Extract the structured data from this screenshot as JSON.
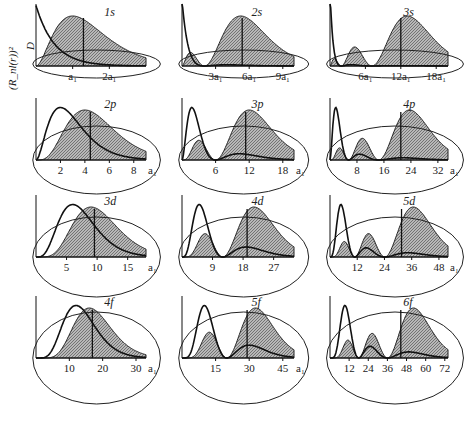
{
  "figure": {
    "y_axis_label_outer": "(R_nl(r))²",
    "y_axis_label_inner": "D",
    "x_axis_label": "r",
    "unit_label": "a₁"
  },
  "panels": [
    {
      "title": "1s",
      "n": 1,
      "l": 0,
      "ticks": [
        "a₁",
        "2a₁"
      ],
      "tick_values": [
        1,
        2
      ],
      "xmax": 3,
      "peaks": 1
    },
    {
      "title": "2s",
      "n": 2,
      "l": 0,
      "ticks": [
        "3a₁",
        "6a₁",
        "9a₁"
      ],
      "tick_values": [
        3,
        6,
        9
      ],
      "xmax": 10,
      "peaks": 2
    },
    {
      "title": "3s",
      "n": 3,
      "l": 0,
      "ticks": [
        "6a₁",
        "12a₁",
        "18a₁"
      ],
      "tick_values": [
        6,
        12,
        18
      ],
      "xmax": 20,
      "peaks": 3
    },
    {
      "title": "2p",
      "n": 2,
      "l": 1,
      "ticks": [
        "2",
        "4",
        "6",
        "8",
        "a₁"
      ],
      "tick_values": [
        2,
        4,
        6,
        8
      ],
      "xmax": 9,
      "peaks": 1
    },
    {
      "title": "3p",
      "n": 3,
      "l": 1,
      "ticks": [
        "6",
        "12",
        "18",
        "a₁"
      ],
      "tick_values": [
        6,
        12,
        18
      ],
      "xmax": 20,
      "peaks": 2
    },
    {
      "title": "4p",
      "n": 4,
      "l": 1,
      "ticks": [
        "8",
        "16",
        "24",
        "32",
        "a₁"
      ],
      "tick_values": [
        8,
        16,
        24,
        32
      ],
      "xmax": 35,
      "peaks": 3
    },
    {
      "title": "3d",
      "n": 3,
      "l": 2,
      "ticks": [
        "5",
        "10",
        "15",
        "a₁"
      ],
      "tick_values": [
        5,
        10,
        15
      ],
      "xmax": 18,
      "peaks": 1
    },
    {
      "title": "4d",
      "n": 4,
      "l": 2,
      "ticks": [
        "9",
        "18",
        "27"
      ],
      "tick_values": [
        9,
        18,
        27
      ],
      "xmax": 33,
      "peaks": 2
    },
    {
      "title": "5d",
      "n": 5,
      "l": 2,
      "ticks": [
        "12",
        "24",
        "36",
        "48",
        "a₁"
      ],
      "tick_values": [
        12,
        24,
        36,
        48
      ],
      "xmax": 52,
      "peaks": 3
    },
    {
      "title": "4f",
      "n": 4,
      "l": 3,
      "ticks": [
        "10",
        "20",
        "30",
        "a₁"
      ],
      "tick_values": [
        10,
        20,
        30
      ],
      "xmax": 33,
      "peaks": 1
    },
    {
      "title": "5f",
      "n": 5,
      "l": 3,
      "ticks": [
        "15",
        "30",
        "45",
        "a₁"
      ],
      "tick_values": [
        15,
        30,
        45
      ],
      "xmax": 50,
      "peaks": 2
    },
    {
      "title": "6f",
      "n": 6,
      "l": 3,
      "ticks": [
        "12",
        "24",
        "36",
        "48",
        "60",
        "72"
      ],
      "tick_values": [
        12,
        24,
        36,
        48,
        60,
        72
      ],
      "xmax": 74,
      "peaks": 3
    }
  ],
  "colors": {
    "line": "#111111",
    "hatch": "#8a8a8a",
    "background": "#ffffff"
  }
}
